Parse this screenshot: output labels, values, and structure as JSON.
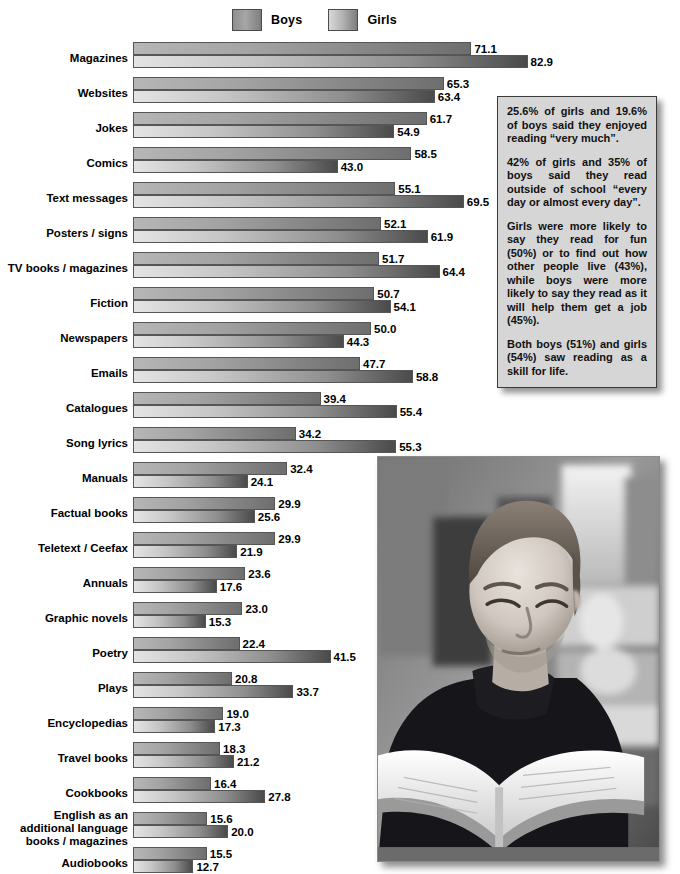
{
  "legend": {
    "entries": [
      {
        "key": "boys",
        "label": "Boys",
        "swatch": "gradient-gray-swatch"
      },
      {
        "key": "girls",
        "label": "Girls",
        "swatch": "gradient-gray-swatch"
      }
    ]
  },
  "chart_data": {
    "type": "bar",
    "orientation": "horizontal",
    "title": "",
    "xlabel": "",
    "ylabel": "",
    "xlim": [
      0,
      82.9
    ],
    "grid": false,
    "legend_position": "top-center",
    "categories": [
      "Magazines",
      "Websites",
      "Jokes",
      "Comics",
      "Text messages",
      "Posters / signs",
      "TV books / magazines",
      "Fiction",
      "Newspapers",
      "Emails",
      "Catalogues",
      "Song lyrics",
      "Manuals",
      "Factual books",
      "Teletext / Ceefax",
      "Annuals",
      "Graphic novels",
      "Poetry",
      "Plays",
      "Encyclopedias",
      "Travel books",
      "Cookbooks",
      "English as an\nadditional language\nbooks / magazines",
      "Audiobooks"
    ],
    "series": [
      {
        "name": "Boys",
        "values": [
          71.1,
          65.3,
          61.7,
          58.5,
          55.1,
          52.1,
          51.7,
          50.7,
          50.0,
          47.7,
          39.4,
          34.2,
          32.4,
          29.9,
          29.9,
          23.6,
          23.0,
          22.4,
          20.8,
          19.0,
          18.3,
          16.4,
          15.6,
          15.5
        ],
        "labels": [
          "71.1",
          "65.3",
          "61.7",
          "58.5",
          "55.1",
          "52.1",
          "51.7",
          "50.7",
          "50.0",
          "47.7",
          "39.4",
          "34.2",
          "32.4",
          "29.9",
          "29.9",
          "23.6",
          "23.0",
          "22.4",
          "20.8",
          "19.0",
          "18.3",
          "16.4",
          "15.6",
          "15.5"
        ]
      },
      {
        "name": "Girls",
        "values": [
          82.9,
          63.4,
          54.9,
          43.0,
          69.5,
          61.9,
          64.4,
          54.1,
          44.3,
          58.8,
          55.4,
          55.3,
          24.1,
          25.6,
          21.9,
          17.6,
          15.3,
          41.5,
          33.7,
          17.3,
          21.2,
          27.8,
          20.0,
          12.7
        ],
        "labels": [
          "82.9",
          "63.4",
          "54.9",
          "43.0",
          "69.5",
          "61.9",
          "64.4",
          "54.1",
          "44.3",
          "58.8",
          "55.4",
          "55.3",
          "24.1",
          "25.6",
          "21.9",
          "17.6",
          "15.3",
          "41.5",
          "33.7",
          "17.3",
          "21.2",
          "27.8",
          "20.0",
          "12.7"
        ]
      }
    ]
  },
  "callout": {
    "paragraphs": [
      "25.6% of girls and 19.6% of boys said they enjoyed reading “very much”.",
      "42% of girls and 35% of boys said they read outside of school “every day or almost every day”.",
      "Girls were more likely to say they read for fun (50%) or to find out how other people live (43%), while boys were more likely to say they read as it will help them get a job (45%).",
      "Both boys (51%) and girls (54%) saw reading as a skill for life."
    ]
  },
  "photo": {
    "alt": "boy-reading-book-in-library",
    "style": "black-and-white-photograph"
  },
  "colors": {
    "boys_bar_light": "#b6b6b6",
    "boys_bar_dark": "#6e6e6e",
    "girls_bar_light": "#e4e4e4",
    "girls_bar_dark": "#4a4a4a",
    "callout_background": "#d6d6d6",
    "callout_border": "#3a3a3a",
    "text": "#000000",
    "page_background": "#ffffff"
  }
}
